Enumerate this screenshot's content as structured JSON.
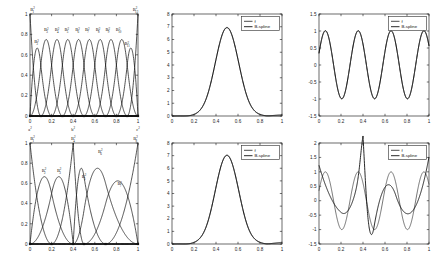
{
  "figure": {
    "title": "",
    "background": "#ffffff",
    "rows": 2,
    "cols": 3,
    "colors": {
      "axis": "#1a1a1a",
      "curve_f": "#3a3a3a",
      "curve_spline": "#111111",
      "background": "#ffffff"
    }
  },
  "legend_labels": {
    "f": "f",
    "bspline": "B-spline"
  },
  "chart_data": [
    {
      "id": "top-left-basis",
      "type": "line",
      "title": "",
      "xlabel": "",
      "ylabel": "",
      "xlim": [
        0,
        1
      ],
      "ylim": [
        0,
        1
      ],
      "xticks": [
        0,
        0.2,
        0.4,
        0.6,
        0.8,
        1
      ],
      "xticklabels": [
        "0",
        "0.2",
        "0.4",
        "0.6",
        "0.8",
        "1"
      ],
      "yticks": [
        0,
        0.2,
        0.4,
        0.6,
        0.8,
        1
      ],
      "yticklabels": [
        "0",
        "0.2",
        "0.4",
        "0.6",
        "0.8",
        "1"
      ],
      "grid": false,
      "legend": "none",
      "description": "Uniform quadratic B-spline basis functions of degree 2 over a uniform knot vector on [0,1]",
      "degree": 2,
      "knots_uniform": true,
      "n_basis": 12,
      "knot_positions": [
        0,
        0,
        0,
        0.1,
        0.2,
        0.3,
        0.4,
        0.5,
        0.6,
        0.7,
        0.8,
        0.9,
        1,
        1,
        1
      ],
      "curve_labels": [
        {
          "text": "B",
          "sup": "2",
          "sub": "1",
          "x": 0.0,
          "y": 1.0
        },
        {
          "text": "B",
          "sup": "2",
          "sub": "2",
          "x": 0.06,
          "y": 0.68
        },
        {
          "text": "B",
          "sup": "2",
          "sub": "3",
          "x": 0.15,
          "y": 0.8
        },
        {
          "text": "B",
          "sup": "2",
          "sub": "4",
          "x": 0.25,
          "y": 0.8
        },
        {
          "text": "B",
          "sup": "2",
          "sub": "5",
          "x": 0.34,
          "y": 0.8
        },
        {
          "text": "B",
          "sup": "2",
          "sub": "6",
          "x": 0.44,
          "y": 0.8
        },
        {
          "text": "B",
          "sup": "2",
          "sub": "7",
          "x": 0.53,
          "y": 0.8
        },
        {
          "text": "B",
          "sup": "2",
          "sub": "8",
          "x": 0.63,
          "y": 0.8
        },
        {
          "text": "B",
          "sup": "2",
          "sub": "9",
          "x": 0.72,
          "y": 0.8
        },
        {
          "text": "B",
          "sup": "2",
          "sub": "10",
          "x": 0.82,
          "y": 0.8
        },
        {
          "text": "B",
          "sup": "2",
          "sub": "11",
          "x": 0.9,
          "y": 0.66
        },
        {
          "text": "B",
          "sup": "2",
          "sub": "12",
          "x": 1.0,
          "y": 1.0
        }
      ],
      "axis_annotations": [
        {
          "text": "a",
          "sup": "2",
          "x": 0.0
        },
        {
          "text": "b",
          "sup": "2",
          "x": 0.4
        },
        {
          "text": "c",
          "sup": "2",
          "x": 1.0
        }
      ]
    },
    {
      "id": "top-middle-bump",
      "type": "line",
      "title": "",
      "xlabel": "",
      "ylabel": "",
      "xlim": [
        0,
        1
      ],
      "ylim": [
        0,
        8
      ],
      "xticks": [
        0,
        0.2,
        0.4,
        0.6,
        0.8,
        1
      ],
      "xticklabels": [
        "0",
        "0.2",
        "0.4",
        "0.6",
        "0.8",
        "1"
      ],
      "yticks": [
        0,
        1,
        2,
        3,
        4,
        5,
        6,
        7,
        8
      ],
      "yticklabels": [
        "0",
        "1",
        "2",
        "3",
        "4",
        "5",
        "6",
        "7",
        "8"
      ],
      "grid": false,
      "legend": "upper right",
      "legend_entries": [
        "f",
        "B-spline"
      ],
      "description": "Target bump function f and its B-spline approximation; curves nearly coincide",
      "peak": {
        "x": 0.5,
        "y": 6.95
      },
      "series": [
        {
          "name": "f",
          "peak_y": 6.95,
          "peak_x": 0.5
        },
        {
          "name": "B-spline",
          "peak_y": 6.95,
          "peak_x": 0.5
        }
      ]
    },
    {
      "id": "top-right-sine",
      "type": "line",
      "title": "",
      "xlabel": "",
      "ylabel": "",
      "xlim": [
        0,
        1
      ],
      "ylim": [
        -1.5,
        1.5
      ],
      "xticks": [
        0,
        0.2,
        0.4,
        0.6,
        0.8,
        1
      ],
      "xticklabels": [
        "0",
        "0.2",
        "0.4",
        "0.6",
        "0.8",
        "1"
      ],
      "yticks": [
        -1.5,
        -1,
        -0.5,
        0,
        0.5,
        1,
        1.5
      ],
      "yticklabels": [
        "-1.5",
        "-1",
        "-0.5",
        "0",
        "0.5",
        "1",
        "1.5"
      ],
      "grid": false,
      "legend": "upper right",
      "legend_entries": [
        "f",
        "B-spline"
      ],
      "description": "Oscillatory target f (about three periods, amplitude 1) and B-spline approximation; curves nearly coincide",
      "periods": 3.35,
      "amplitude": 1.0,
      "series": [
        {
          "name": "f",
          "amplitude": 1.0,
          "periods": 3.35
        },
        {
          "name": "B-spline",
          "amplitude": 1.0,
          "periods": 3.35
        }
      ]
    },
    {
      "id": "bottom-left-basis",
      "type": "line",
      "title": "",
      "xlabel": "",
      "ylabel": "",
      "xlim": [
        0,
        1
      ],
      "ylim": [
        0,
        1
      ],
      "xticks": [
        0,
        0.2,
        0.4,
        0.6,
        0.8,
        1
      ],
      "xticklabels": [
        "0",
        "0.2",
        "0.4",
        "0.6",
        "0.8",
        "1"
      ],
      "yticks": [
        0,
        0.2,
        0.4,
        0.6,
        0.8,
        1
      ],
      "yticklabels": [
        "0",
        "0.2",
        "0.4",
        "0.6",
        "0.8",
        "1"
      ],
      "grid": false,
      "legend": "none",
      "description": "Non-uniform quadratic B-spline basis functions of degree 2 with a repeated interior knot at 0.4",
      "degree": 2,
      "knots_uniform": false,
      "n_basis": 8,
      "knot_positions": [
        0,
        0,
        0,
        0.2,
        0.4,
        0.4,
        0.5,
        0.7,
        1,
        1,
        1
      ],
      "curve_labels": [
        {
          "text": "B",
          "sup": "2",
          "sub": "1",
          "x": 0.0,
          "y": 1.0
        },
        {
          "text": "B",
          "sup": "2",
          "sub": "2",
          "x": 0.13,
          "y": 0.68
        },
        {
          "text": "B",
          "sup": "2",
          "sub": "3",
          "x": 0.27,
          "y": 0.68
        },
        {
          "text": "B",
          "sup": "2",
          "sub": "4",
          "x": 0.4,
          "y": 1.0
        },
        {
          "text": "B",
          "sup": "2",
          "sub": "5",
          "x": 0.5,
          "y": 0.62
        },
        {
          "text": "B",
          "sup": "2",
          "sub": "6",
          "x": 0.65,
          "y": 0.87
        },
        {
          "text": "B",
          "sup": "2",
          "sub": "7",
          "x": 0.83,
          "y": 0.55
        },
        {
          "text": "B",
          "sup": "2",
          "sub": "8",
          "x": 1.0,
          "y": 1.0
        }
      ],
      "axis_annotations": []
    },
    {
      "id": "bottom-middle-bump",
      "type": "line",
      "title": "",
      "xlabel": "",
      "ylabel": "",
      "xlim": [
        0,
        1
      ],
      "ylim": [
        0,
        8
      ],
      "xticks": [
        0,
        0.2,
        0.4,
        0.6,
        0.8,
        1
      ],
      "xticklabels": [
        "0",
        "0.2",
        "0.4",
        "0.6",
        "0.8",
        "1"
      ],
      "yticks": [
        0,
        1,
        2,
        3,
        4,
        5,
        6,
        7,
        8
      ],
      "yticklabels": [
        "0",
        "1",
        "2",
        "3",
        "4",
        "5",
        "6",
        "7",
        "8"
      ],
      "grid": false,
      "legend": "upper right",
      "legend_entries": [
        "f",
        "B-spline"
      ],
      "description": "Target bump function f and its B-spline approximation on the non-uniform knot set; curves nearly coincide",
      "peak": {
        "x": 0.5,
        "y": 7.05
      },
      "series": [
        {
          "name": "f",
          "peak_y": 7.05,
          "peak_x": 0.5
        },
        {
          "name": "B-spline",
          "peak_y": 7.05,
          "peak_x": 0.5
        }
      ]
    },
    {
      "id": "bottom-right-sine",
      "type": "line",
      "title": "",
      "xlabel": "",
      "ylabel": "",
      "xlim": [
        0,
        1
      ],
      "ylim": [
        -1.5,
        2
      ],
      "xticks": [
        0,
        0.2,
        0.4,
        0.6,
        0.8,
        1
      ],
      "xticklabels": [
        "0",
        "0.2",
        "0.4",
        "0.6",
        "0.8",
        "1"
      ],
      "yticks": [
        -1.5,
        -1,
        -0.5,
        0,
        0.5,
        1,
        1.5,
        2
      ],
      "yticklabels": [
        "-1.5",
        "-1",
        "-0.5",
        "0",
        "0.5",
        "1",
        "1.5",
        "2"
      ],
      "grid": false,
      "legend": "upper right",
      "legend_entries": [
        "f",
        "B-spline"
      ],
      "description": "Oscillatory target f and a poor B-spline approximation on the coarse non-uniform knot set; the spline overshoots to about 1.7 near x=0.4 and undershoots the peak near x=0.75",
      "periods": 3.35,
      "amplitude": 1.0,
      "spline_overshoot": {
        "x": 0.4,
        "y": 1.7
      },
      "series": [
        {
          "name": "f",
          "amplitude": 1.0,
          "periods": 3.35
        },
        {
          "name": "B-spline",
          "amplitude": 1.0,
          "periods": 3.35,
          "poor_fit": true
        }
      ]
    }
  ]
}
